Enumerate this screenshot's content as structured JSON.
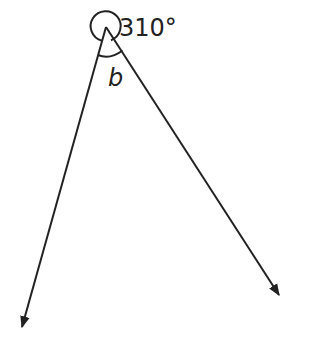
{
  "diagram": {
    "type": "angle-diagram",
    "vertex": {
      "x": 106,
      "y": 27
    },
    "rays": [
      {
        "name": "left-ray",
        "end": {
          "x": 21,
          "y": 330
        }
      },
      {
        "name": "right-ray",
        "end": {
          "x": 281,
          "y": 298
        }
      }
    ],
    "reflex_angle_label": "310°",
    "interior_angle_label": "b",
    "stroke_color": "#222222"
  }
}
